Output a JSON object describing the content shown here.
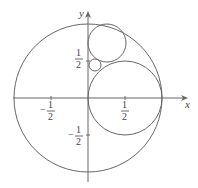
{
  "diagram": {
    "axes": {
      "x_label": "x",
      "y_label": "y"
    },
    "ticks": {
      "x_neg": {
        "num": "1",
        "den": "2",
        "sign": "−"
      },
      "x_pos": {
        "num": "1",
        "den": "2"
      },
      "y_pos": {
        "num": "1",
        "den": "2"
      },
      "y_neg": {
        "num": "1",
        "den": "2",
        "sign": "−"
      }
    },
    "circles": [
      {
        "name": "unit-circle",
        "cx": 0,
        "cy": 0,
        "r": 1
      },
      {
        "name": "large-inner-circle",
        "cx": 0.5,
        "cy": 0,
        "r": 0.5
      },
      {
        "name": "upper-circle",
        "cx": 0.333,
        "cy": 0.667,
        "r": 0.333
      },
      {
        "name": "small-circle",
        "cx": 0.1,
        "cy": 0.4,
        "r": 0.1
      }
    ],
    "stroke_color": "#666666"
  }
}
